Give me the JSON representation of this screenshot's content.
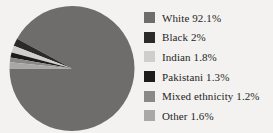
{
  "background_color": "#f3f2f0",
  "chart_data": {
    "type": "pie",
    "title": "",
    "subtitle": "",
    "xlabel": "",
    "ylabel": "",
    "grid": false,
    "legend_position": "right",
    "start_angle_deg": 180,
    "direction": "counterclockwise",
    "categories": [
      "White",
      "Black",
      "Indian",
      "Pakistani",
      "Mixed ethnicity",
      "Other"
    ],
    "values": [
      92.1,
      2,
      1.8,
      1.3,
      1.2,
      1.6
    ],
    "value_suffix": "%",
    "colors": [
      "#6e6d6b",
      "#2b2a29",
      "#cfcecc",
      "#1d1c1b",
      "#8a8987",
      "#a9a8a6"
    ],
    "slices": [
      {
        "label": "White",
        "value": 92.1,
        "display": "White 92.1%",
        "color": "#6e6d6b"
      },
      {
        "label": "Black",
        "value": 2,
        "display": "Black 2%",
        "color": "#2b2a29"
      },
      {
        "label": "Indian",
        "value": 1.8,
        "display": "Indian 1.8%",
        "color": "#cfcecc"
      },
      {
        "label": "Pakistani",
        "value": 1.3,
        "display": "Pakistani 1.3%",
        "color": "#1d1c1b"
      },
      {
        "label": "Mixed ethnicity",
        "value": 1.2,
        "display": "Mixed ethnicity 1.2%",
        "color": "#8a8987"
      },
      {
        "label": "Other",
        "value": 1.6,
        "display": "Other 1.6%",
        "color": "#a9a8a6"
      }
    ]
  },
  "legend": {
    "items": [
      {
        "text": "White 92.1%",
        "color": "#6e6d6b"
      },
      {
        "text": "Black 2%",
        "color": "#2b2a29"
      },
      {
        "text": "Indian 1.8%",
        "color": "#cfcecc"
      },
      {
        "text": "Pakistani 1.3%",
        "color": "#1d1c1b"
      },
      {
        "text": "Mixed ethnicity 1.2%",
        "color": "#8a8987"
      },
      {
        "text": "Other 1.6%",
        "color": "#a9a8a6"
      }
    ]
  }
}
